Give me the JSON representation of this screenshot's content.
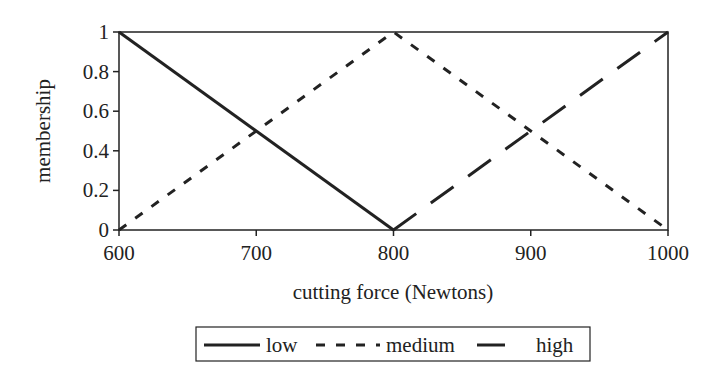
{
  "chart_data": {
    "type": "line",
    "title": "",
    "xlabel": "cutting force (Newtons)",
    "ylabel": "membership",
    "xlim": [
      600,
      1000
    ],
    "ylim": [
      0,
      1
    ],
    "x_ticks": [
      "600",
      "700",
      "800",
      "900",
      "1000"
    ],
    "y_ticks": [
      "0",
      "0.2",
      "0.4",
      "0.6",
      "0.8",
      "1"
    ],
    "grid": false,
    "legend_position": "bottom",
    "series": [
      {
        "name": "low",
        "style": "solid",
        "x": [
          600,
          800
        ],
        "y": [
          1,
          0
        ]
      },
      {
        "name": "medium",
        "style": "short-dash",
        "x": [
          600,
          800,
          1000
        ],
        "y": [
          0,
          1,
          0
        ]
      },
      {
        "name": "high",
        "style": "long-dash",
        "x": [
          800,
          1000
        ],
        "y": [
          0,
          1
        ]
      }
    ]
  },
  "legend": {
    "low": "low",
    "medium": "medium",
    "high": "high"
  }
}
